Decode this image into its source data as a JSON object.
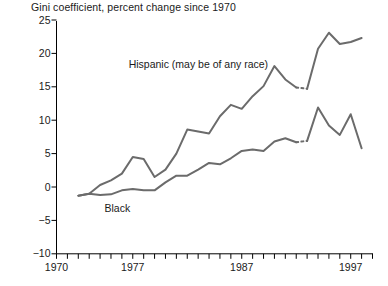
{
  "chart_data": {
    "type": "line",
    "title": "Gini coefficient, percent change since 1970",
    "xlabel": "",
    "ylabel": "",
    "ylim": [
      -10,
      25
    ],
    "xlim": [
      1970,
      1999
    ],
    "yticks": [
      -10,
      -5,
      0,
      5,
      10,
      15,
      20,
      25
    ],
    "ytick_labels": [
      "−10",
      "−5",
      "0",
      "5",
      "10",
      "15",
      "20",
      "25"
    ],
    "xticks": [
      1970,
      1971,
      1972,
      1973,
      1974,
      1975,
      1976,
      1977,
      1978,
      1979,
      1980,
      1981,
      1982,
      1983,
      1984,
      1985,
      1986,
      1987,
      1988,
      1989,
      1990,
      1991,
      1992,
      1993,
      1994,
      1995,
      1996,
      1997,
      1998,
      1999
    ],
    "xtick_labels_shown": [
      {
        "year": 1970,
        "label": "1970"
      },
      {
        "year": 1977,
        "label": "1977"
      },
      {
        "year": 1987,
        "label": "1987"
      },
      {
        "year": 1997,
        "label": "1997"
      }
    ],
    "grid": false,
    "legend_position": "inline-annotations",
    "line_color": "#6b6b6b",
    "axis_color": "#000000",
    "series": [
      {
        "name": "Hispanic (may be of any race)",
        "label": "Hispanic (may be of any race)",
        "label_x": 1983.0,
        "label_y": 18.4,
        "break_segment": {
          "from_year": 1992,
          "to_year": 1993
        },
        "x": [
          1972,
          1973,
          1974,
          1975,
          1976,
          1977,
          1978,
          1979,
          1980,
          1981,
          1982,
          1983,
          1984,
          1985,
          1986,
          1987,
          1988,
          1989,
          1990,
          1991,
          1992,
          1993,
          1994,
          1995,
          1996,
          1997,
          1998
        ],
        "values": [
          -1.3,
          -1.0,
          0.3,
          1.0,
          2.0,
          4.5,
          4.2,
          1.5,
          2.6,
          5.0,
          8.6,
          8.3,
          8.0,
          10.6,
          12.3,
          11.7,
          13.6,
          15.1,
          18.1,
          16.1,
          14.9,
          14.7,
          20.7,
          23.1,
          21.4,
          21.7,
          22.3
        ]
      },
      {
        "name": "Black",
        "label": "Black",
        "label_x": 1975.6,
        "label_y": -3.2,
        "break_segment": {
          "from_year": 1992,
          "to_year": 1993
        },
        "x": [
          1972,
          1973,
          1974,
          1975,
          1976,
          1977,
          1978,
          1979,
          1980,
          1981,
          1982,
          1983,
          1984,
          1985,
          1986,
          1987,
          1988,
          1989,
          1990,
          1991,
          1992,
          1993,
          1994,
          1995,
          1996,
          1997,
          1998
        ],
        "values": [
          -1.3,
          -1.0,
          -1.2,
          -1.1,
          -0.5,
          -0.3,
          -0.5,
          -0.5,
          0.7,
          1.7,
          1.7,
          2.6,
          3.6,
          3.4,
          4.3,
          5.4,
          5.6,
          5.4,
          6.8,
          7.3,
          6.7,
          6.9,
          11.9,
          9.2,
          7.8,
          10.9,
          5.8
        ]
      }
    ]
  }
}
